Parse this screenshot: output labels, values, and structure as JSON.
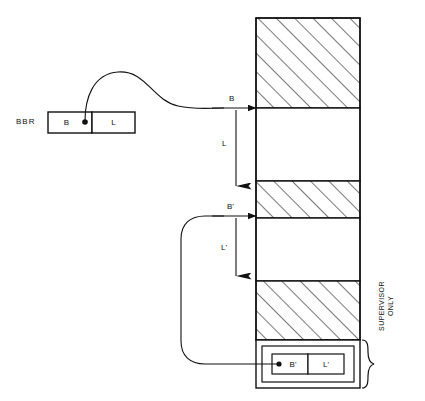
{
  "diagram": {
    "register": {
      "name": "BBR",
      "fields": [
        {
          "label": "B"
        },
        {
          "label": "L"
        }
      ]
    },
    "memory_column": {
      "bands": [
        {
          "fill": "hatched"
        },
        {
          "fill": "white"
        },
        {
          "fill": "hatched"
        },
        {
          "fill": "white"
        },
        {
          "fill": "hatched"
        }
      ]
    },
    "supervisor_block": {
      "fields": [
        {
          "label": "B'"
        },
        {
          "label": "L'"
        }
      ],
      "annotation": "SUPERVISOR\nONLY"
    },
    "pointers": [
      {
        "label": "B",
        "kind": "base-arrow"
      },
      {
        "label": "L",
        "kind": "length-arrow"
      },
      {
        "label": "B'",
        "kind": "base-arrow"
      },
      {
        "label": "L'",
        "kind": "length-arrow"
      }
    ],
    "colors": {
      "stroke": "#111111",
      "background": "#ffffff",
      "hatch": "#555555"
    }
  }
}
